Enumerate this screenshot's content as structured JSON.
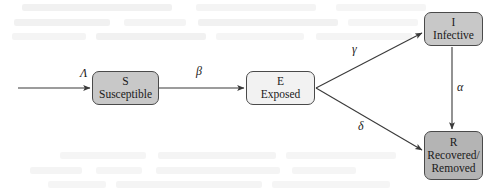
{
  "diagram": {
    "background_color": "#ffffff",
    "stroke_color": "#4a4a4a",
    "text_color": "#1a1a1a",
    "nodes": [
      {
        "id": "S",
        "symbol": "S",
        "name": "Susceptible",
        "fill": "#c8c8c8",
        "x": 92,
        "y": 71,
        "w": 67,
        "h": 34
      },
      {
        "id": "E",
        "symbol": "E",
        "name": "Exposed",
        "fill": "#f2f2f2",
        "x": 246,
        "y": 71,
        "w": 69,
        "h": 34
      },
      {
        "id": "I",
        "symbol": "I",
        "name": "Infective",
        "fill": "#c8c8c8",
        "x": 424,
        "y": 12,
        "w": 59,
        "h": 34
      },
      {
        "id": "R",
        "symbol": "R",
        "name_line1": "Recovered/",
        "name_line2": "Removed",
        "fill": "#b4b4b4",
        "x": 424,
        "y": 131,
        "w": 59,
        "h": 49
      }
    ],
    "edges": [
      {
        "id": "inflow-to-S",
        "label": "Λ",
        "from": "external",
        "to": "S",
        "label_x": 80,
        "label_y": 66
      },
      {
        "id": "S-to-E",
        "label": "β",
        "from": "S",
        "to": "E",
        "label_x": 196,
        "label_y": 64
      },
      {
        "id": "E-to-I",
        "label": "γ",
        "from": "E",
        "to": "I",
        "label_x": 352,
        "label_y": 42
      },
      {
        "id": "E-to-R",
        "label": "δ",
        "from": "E",
        "to": "R",
        "label_x": 358,
        "label_y": 119
      },
      {
        "id": "I-to-R",
        "label": "α",
        "from": "I",
        "to": "R",
        "label_x": 457,
        "label_y": 80
      }
    ]
  }
}
